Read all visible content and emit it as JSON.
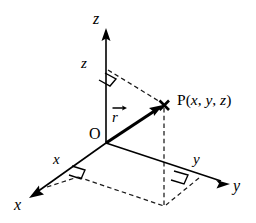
{
  "figure": {
    "type": "3d-cartesian-coordinate-diagram",
    "background_color": "#ffffff",
    "stroke_color": "#000000"
  },
  "labels": {
    "z_axis": "z",
    "z_height": "z",
    "x_axis": "x",
    "x_segment": "x",
    "y_axis": "y",
    "y_segment": "y",
    "origin": "O",
    "vector_r": "r",
    "point_p": "P(x, y, z)"
  },
  "geometry": {
    "origin": {
      "x": 106,
      "y": 143
    },
    "point_p": {
      "x": 164,
      "y": 105
    },
    "z_axis_tip": {
      "x": 106,
      "y": 30
    },
    "z_foot": {
      "x": 106,
      "y": 70
    },
    "x_axis_tip": {
      "x": 30,
      "y": 197
    },
    "x_foot": {
      "x": 74,
      "y": 174
    },
    "y_axis_tip": {
      "x": 229,
      "y": 184
    },
    "y_foot": {
      "x": 199,
      "y": 178
    },
    "projection_foot": {
      "x": 164,
      "y": 205
    },
    "plane_corner": {
      "x": 131,
      "y": 189
    }
  },
  "elements": {
    "axes": [
      "x-axis",
      "y-axis",
      "z-axis"
    ],
    "vector": "position-vector-r",
    "right_angle_markers": 3,
    "dashed_construction_lines": 5,
    "point_marker": "x-cross"
  }
}
